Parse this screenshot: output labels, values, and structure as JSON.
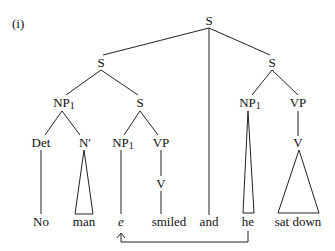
{
  "example_label": "(i)",
  "nodes": {
    "root": "S",
    "s_left": "S",
    "s_right": "S",
    "np1_left": "NP",
    "np1_left_sub": "1",
    "s_inner": "S",
    "det": "Det",
    "nbar": "N′",
    "np1_inner": "NP",
    "np1_inner_sub": "1",
    "vp_inner": "VP",
    "v_inner": "V",
    "np1_right": "NP",
    "np1_right_sub": "1",
    "vp_right": "VP",
    "v_right": "V"
  },
  "words": {
    "w1": "No",
    "w2": "man",
    "w3": "e",
    "w4": "smiled",
    "w5": "and",
    "w6": "he",
    "w7": "sat down"
  },
  "arrow": {
    "from": "he",
    "to": "e"
  }
}
